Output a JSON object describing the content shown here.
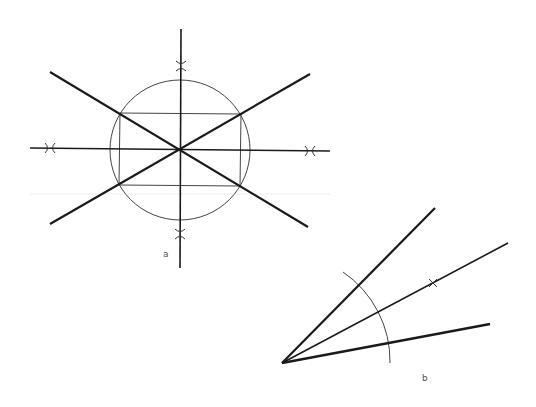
{
  "colors": {
    "background": "#ffffff",
    "thick_line": "#1a1a1a",
    "thin_line": "#444444",
    "artifact_line": "#eeeeee",
    "label": "#555555"
  },
  "figure_a": {
    "label": "a",
    "label_pos": [
      163,
      257
    ],
    "center": [
      180,
      150
    ],
    "circle_radius": 70,
    "vertical_axis": {
      "x1": 181,
      "y1": 29,
      "x2": 180,
      "y2": 268
    },
    "horizontal_axis": {
      "x1": 30,
      "y1": 148,
      "x2": 330,
      "y2": 151
    },
    "diagonals": [
      {
        "name": "diagonal-descending",
        "x1": 50,
        "y1": 72,
        "x2": 308,
        "y2": 227
      },
      {
        "name": "diagonal-ascending",
        "x1": 50,
        "y1": 224,
        "x2": 310,
        "y2": 74
      }
    ],
    "rectangle": {
      "tl": [
        120,
        113
      ],
      "tr": [
        241,
        114
      ],
      "br": [
        240,
        186
      ],
      "bl": [
        119,
        185
      ]
    },
    "construction_marks": [
      {
        "name": "mark-top",
        "x": 181,
        "y": 66
      },
      {
        "name": "mark-bottom",
        "x": 180,
        "y": 234
      },
      {
        "name": "mark-left",
        "x": 50,
        "y": 148
      },
      {
        "name": "mark-right",
        "x": 310,
        "y": 151
      }
    ]
  },
  "figure_b": {
    "label": "b",
    "label_pos": [
      422,
      381
    ],
    "vertex": [
      282,
      363
    ],
    "rays": [
      {
        "name": "ray-upper",
        "x2": 435,
        "y2": 208,
        "weight": "thick"
      },
      {
        "name": "ray-bisector",
        "x2": 508,
        "y2": 243,
        "weight": "thin"
      },
      {
        "name": "ray-lower",
        "x2": 490,
        "y2": 324,
        "weight": "thick"
      }
    ],
    "arc": {
      "start": [
        343,
        272
      ],
      "end": [
        390,
        363
      ],
      "radius": 108
    },
    "bisector_mark": {
      "x": 433,
      "y": 283
    }
  },
  "artifact_line": {
    "x1": 30,
    "y1": 194,
    "x2": 330,
    "y2": 194
  }
}
